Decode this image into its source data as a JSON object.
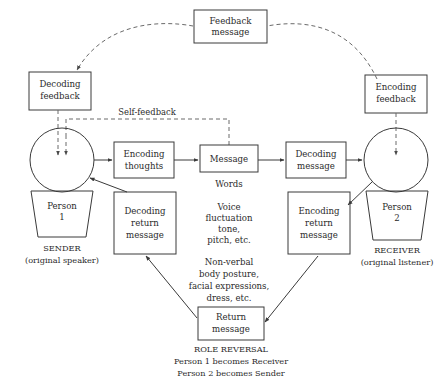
{
  "diagram": {
    "colors": {
      "background": "#ffffff",
      "stroke": "#3a3a3a",
      "dashed_stroke": "#6a6a6a",
      "text": "#2b2b2b"
    },
    "boxes": {
      "feedback_message": {
        "line1": "Feedback",
        "line2": "message"
      },
      "decoding_feedback": {
        "line1": "Decoding",
        "line2": "feedback"
      },
      "encoding_feedback": {
        "line1": "Encoding",
        "line2": "feedback"
      },
      "encoding_thoughts": {
        "line1": "Encoding",
        "line2": "thoughts"
      },
      "message": {
        "line1": "Message"
      },
      "decoding_message": {
        "line1": "Decoding",
        "line2": "message"
      },
      "decoding_return_message": {
        "line1": "Decoding",
        "line2": "return",
        "line3": "message"
      },
      "encoding_return_message": {
        "line1": "Encoding",
        "line2": "return",
        "line3": "message"
      },
      "return_message": {
        "line1": "Return",
        "line2": "message"
      }
    },
    "trapezoids": {
      "person_1": {
        "line1": "Person",
        "line2": "1"
      },
      "person_2": {
        "line1": "Person",
        "line2": "2"
      }
    },
    "captions": {
      "sender": {
        "line1": "SENDER",
        "line2": "(original speaker)"
      },
      "receiver": {
        "line1": "RECEIVER",
        "line2": "(original listener)"
      },
      "role_reversal": {
        "line1": "ROLE REVERSAL",
        "line2": "Person 1 becomes Receiver",
        "line3": "Person 2 becomes Sender"
      }
    },
    "link_labels": {
      "self_feedback": "Self-feedback"
    },
    "channel_notes": {
      "words": {
        "line1": "Words"
      },
      "voice": {
        "line1": "Voice",
        "line2": "fluctuation",
        "line3": "tone,",
        "line4": "pitch, etc."
      },
      "nonverbal": {
        "line1": "Non-verbal",
        "line2": "body posture,",
        "line3": "facial expressions,",
        "line4": "dress, etc."
      }
    },
    "icons": {
      "sender_circle": "person-circle-icon",
      "receiver_circle": "person-circle-icon"
    }
  }
}
